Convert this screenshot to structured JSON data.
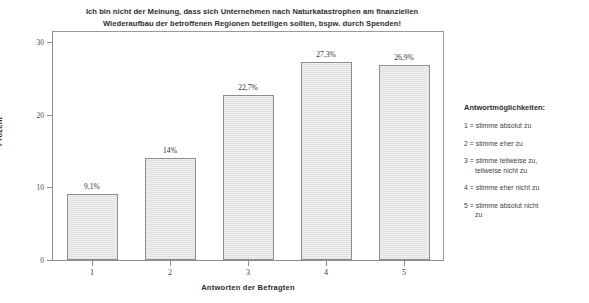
{
  "chart_data": {
    "type": "bar",
    "title": "Ich bin nicht der Meinung, dass sich Unternehmen nach Naturkatastrophen am finanziellen Wiederaufbau der betroffenen Regionen beteiligen sollten, bspw. durch Spenden!",
    "title_lines": [
      "Ich bin nicht der Meinung, dass sich Unternehmen nach Naturkatastrophen am finanziellen",
      "Wiederaufbau der betroffenen Regionen beteiligen sollten, bspw. durch Spenden!"
    ],
    "categories": [
      "1",
      "2",
      "3",
      "4",
      "5"
    ],
    "values": [
      9.1,
      14,
      22.7,
      27.3,
      26.9
    ],
    "value_labels": [
      "9,1%",
      "14%",
      "22,7%",
      "27,3%",
      "26,9%"
    ],
    "xlabel": "Antworten der Befragten",
    "ylabel": "Prozent",
    "ylim": [
      0,
      30
    ],
    "yticks": [
      0,
      10,
      20,
      30
    ],
    "ytick_labels": [
      "0",
      "10",
      "20",
      "30"
    ],
    "grid": false,
    "legend_position": "right-outside",
    "bar_color": "#e4e4e4",
    "bar_border_color": "#8d8d8d",
    "axis_color": "#8e8e8e"
  },
  "legend": {
    "title": "Antwortmöglichkeiten:",
    "items": [
      {
        "first": "1 = stimme absolut zu",
        "second": ""
      },
      {
        "first": "2 = stimme eher zu",
        "second": ""
      },
      {
        "first": "3 = stimme teilweise zu,",
        "second": "teilweise nicht zu"
      },
      {
        "first": "4 = stimme eher nicht zu",
        "second": ""
      },
      {
        "first": "5 = stimme absolut nicht",
        "second": "zu"
      }
    ]
  }
}
